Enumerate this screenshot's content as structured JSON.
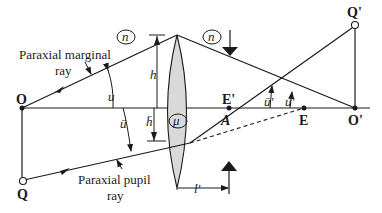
{
  "diagram": {
    "labels": {
      "object_point": "O",
      "object_height_point": "Q",
      "image_point": "O'",
      "image_height_point": "Q'",
      "exit_pupil": "E'",
      "entrance_pupil": "E",
      "lens_point": "A",
      "marginal_ray": [
        "Paraxial marginal",
        "ray"
      ],
      "pupil_ray": [
        "Paraxial pupil",
        "ray"
      ],
      "h": "h",
      "h_bar": "h̄",
      "u": "u",
      "u_bar": "ū",
      "u_prime": "u'",
      "u_bar_prime": "ū'",
      "n_left": "n",
      "n_right": "n",
      "mu": "μ",
      "l_prime": "l'"
    },
    "colors": {
      "line": "#1a1a1a",
      "lens_fill": "#d9d9d9"
    }
  }
}
